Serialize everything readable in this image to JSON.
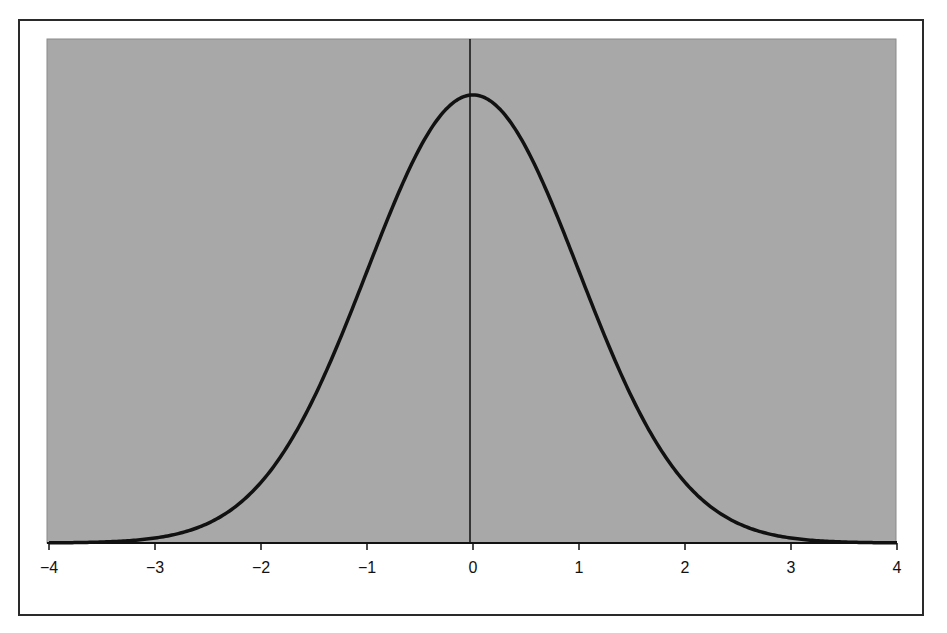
{
  "chart_data": {
    "type": "line",
    "title": "",
    "xlabel": "",
    "ylabel": "",
    "xlim": [
      -4,
      4
    ],
    "ylim": [
      0,
      0.42
    ],
    "grid": false,
    "legend": null,
    "x_ticks": [
      "-4",
      "-3",
      "-2",
      "-1",
      "0",
      "1",
      "2",
      "3",
      "4"
    ],
    "series": [
      {
        "name": "Standard normal density",
        "x": [
          -4,
          -3.5,
          -3,
          -2.5,
          -2,
          -1.5,
          -1,
          -0.5,
          0,
          0.5,
          1,
          1.5,
          2,
          2.5,
          3,
          3.5,
          4
        ],
        "values": [
          0.0001,
          0.0009,
          0.0044,
          0.0175,
          0.054,
          0.1295,
          0.242,
          0.3521,
          0.3989,
          0.3521,
          0.242,
          0.1295,
          0.054,
          0.0175,
          0.0044,
          0.0009,
          0.0001
        ]
      }
    ],
    "annotations": [
      "vertical line at x = 0"
    ],
    "colors": {
      "plot_background": "#a8a8a8",
      "curve": "#111111",
      "frame": "#2a2a2a"
    }
  }
}
